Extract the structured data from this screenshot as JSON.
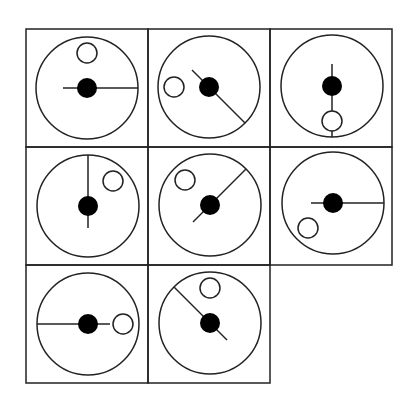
{
  "puzzle": {
    "type": "matrix-reasoning",
    "rows": 3,
    "cols": 3,
    "missing_cell": {
      "row": 2,
      "col": 2
    },
    "stroke_color": "#222222",
    "background": "#ffffff",
    "cell_size": {
      "w": 122,
      "h": 118
    },
    "grid_origin": {
      "x": 26,
      "y": 29
    },
    "outer_circle_radius": 51,
    "black_dot_radius": 10,
    "white_circle_radius": 10,
    "cells": [
      {
        "row": 0,
        "col": 0,
        "center": [
          87,
          88
        ],
        "line": {
          "from": [
            -24,
            0
          ],
          "to": [
            51,
            0
          ]
        },
        "white_circle": [
          0,
          -35
        ]
      },
      {
        "row": 0,
        "col": 1,
        "center": [
          209,
          87
        ],
        "line": {
          "from": [
            -17,
            -17
          ],
          "to": [
            36,
            36
          ]
        },
        "white_circle": [
          -35,
          0
        ]
      },
      {
        "row": 0,
        "col": 2,
        "center": [
          332,
          86
        ],
        "line": {
          "from": [
            0,
            -22
          ],
          "to": [
            0,
            51
          ]
        },
        "white_circle": [
          0,
          35
        ]
      },
      {
        "row": 1,
        "col": 0,
        "center": [
          88,
          206
        ],
        "line": {
          "from": [
            0,
            -51
          ],
          "to": [
            0,
            22
          ]
        },
        "white_circle": [
          25,
          -25
        ]
      },
      {
        "row": 1,
        "col": 1,
        "center": [
          210,
          205
        ],
        "line": {
          "from": [
            36,
            -36
          ],
          "to": [
            -17,
            17
          ]
        },
        "white_circle": [
          -25,
          -25
        ]
      },
      {
        "row": 1,
        "col": 2,
        "center": [
          333,
          203
        ],
        "line": {
          "from": [
            -22,
            0
          ],
          "to": [
            51,
            0
          ]
        },
        "white_circle": [
          -25,
          25
        ]
      },
      {
        "row": 2,
        "col": 0,
        "center": [
          88,
          324
        ],
        "line": {
          "from": [
            -51,
            0
          ],
          "to": [
            22,
            0
          ]
        },
        "white_circle": [
          35,
          0
        ]
      },
      {
        "row": 2,
        "col": 1,
        "center": [
          210,
          323
        ],
        "line": {
          "from": [
            -36,
            -36
          ],
          "to": [
            17,
            17
          ]
        },
        "white_circle": [
          0,
          -35
        ]
      }
    ]
  }
}
